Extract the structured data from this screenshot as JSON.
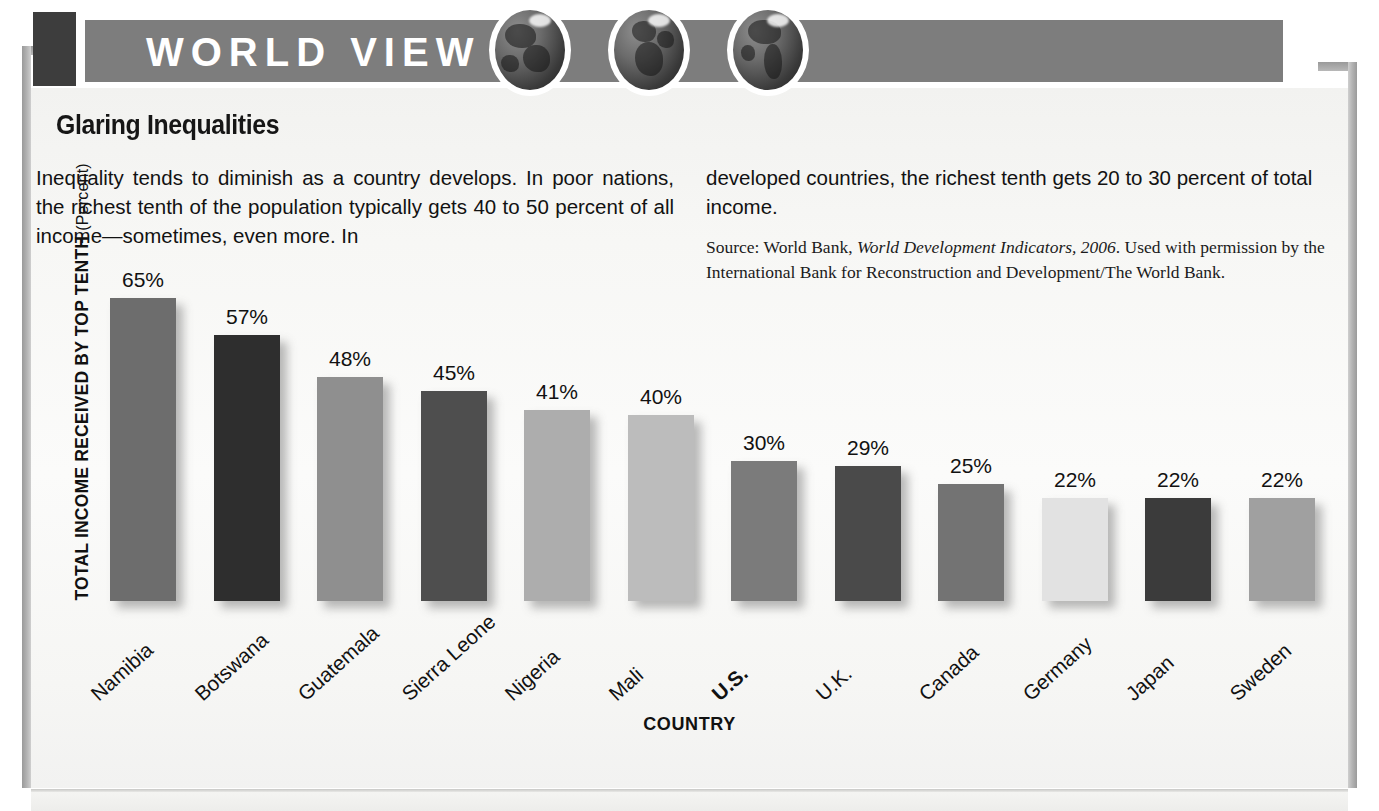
{
  "masthead": {
    "title": "WORLD VIEW",
    "globes": [
      "globe-asia-icon",
      "globe-africa-europe-icon",
      "globe-americas-icon"
    ]
  },
  "article": {
    "headline": "Glaring Inequalities",
    "body_left": "Inequality tends to diminish as a country develops. In poor nations, the richest tenth of the population typically gets 40 to 50 percent of all income—sometimes, even more. In",
    "body_right": "developed countries, the richest tenth gets 20 to 30 percent of total income.",
    "source_prefix": "Source: World Bank, ",
    "source_italic": "World Development Indicators, 2006",
    "source_suffix": ". Used with permission by the International Bank for Reconstruction and Development/The World Bank."
  },
  "chart_data": {
    "type": "bar",
    "title": "Glaring Inequalities",
    "xlabel": "COUNTRY",
    "ylabel": "TOTAL INCOME RECEIVED BY TOP TENTH",
    "ylabel_unit": "(Percent)",
    "ylim": [
      0,
      70
    ],
    "grid": false,
    "legend": "none",
    "value_suffix": "%",
    "categories": [
      "Namibia",
      "Botswana",
      "Guatemala",
      "Sierra Leone",
      "Nigeria",
      "Mali",
      "U.S.",
      "U.K.",
      "Canada",
      "Germany",
      "Japan",
      "Sweden"
    ],
    "values": [
      65,
      57,
      48,
      45,
      41,
      40,
      30,
      29,
      25,
      22,
      22,
      22
    ],
    "value_labels": [
      "65%",
      "57%",
      "48%",
      "45%",
      "41%",
      "40%",
      "30%",
      "29%",
      "25%",
      "22%",
      "22%",
      "22%"
    ],
    "bar_colors": [
      "#6d6d6d",
      "#2e2e2e",
      "#8f8f8f",
      "#4e4e4e",
      "#adadad",
      "#bcbcbc",
      "#7b7b7b",
      "#4a4a4a",
      "#737373",
      "#e2e2e2",
      "#3b3b3b",
      "#a0a0a0"
    ],
    "highlight_category": "U.S."
  }
}
